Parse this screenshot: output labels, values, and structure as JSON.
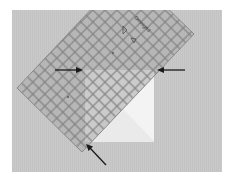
{
  "image": {
    "description": "Quilting ruler placed diagonally over a folded white fabric square on gray background, with three arrows pointing to alignment points",
    "ruler_brand_text": "Omnigrid",
    "colors": {
      "background": "#ffffff",
      "fabric": "#c9c9c9",
      "ruler": "#b4b4b4",
      "ruler_grid": "#7d7d7d",
      "white_square": "#f2f2f2",
      "arrow": "#1a1a1a"
    },
    "arrows": [
      {
        "id": "left-arrow",
        "direction": "right"
      },
      {
        "id": "right-arrow",
        "direction": "left"
      },
      {
        "id": "bottom-arrow",
        "direction": "up-left"
      }
    ]
  }
}
